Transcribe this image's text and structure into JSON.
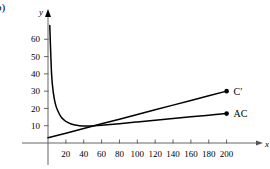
{
  "figure": {
    "panel_label": "b)",
    "x_axis_label": "x",
    "y_axis_label": "y"
  },
  "chart_data": {
    "type": "line",
    "title": "",
    "xlabel": "x",
    "ylabel": "y",
    "xlim": [
      0,
      215
    ],
    "ylim": [
      0,
      70
    ],
    "grid": false,
    "legend_position": "right-inline-labels",
    "xticks": [
      20,
      40,
      60,
      80,
      100,
      120,
      140,
      160,
      180,
      200
    ],
    "yticks": [
      10,
      20,
      30,
      40,
      50,
      60
    ],
    "xtick_labels": [
      "20",
      "40",
      "60",
      "80",
      "100",
      "120",
      "140",
      "160",
      "180",
      "200"
    ],
    "ytick_labels": [
      "10",
      "20",
      "30",
      "40",
      "50",
      "60"
    ],
    "series": [
      {
        "name": "C'",
        "label": "C′",
        "type": "line",
        "endpoint_marker": true,
        "endpoint": {
          "x": 200,
          "y": 30
        },
        "x": [
          0,
          20,
          40,
          60,
          80,
          100,
          120,
          140,
          160,
          180,
          200
        ],
        "y": [
          3.0,
          5.7,
          8.4,
          11.1,
          13.8,
          16.5,
          19.2,
          21.9,
          24.6,
          27.3,
          30.0
        ]
      },
      {
        "name": "AC",
        "label": "AC",
        "type": "curve",
        "endpoint_marker": true,
        "endpoint": {
          "x": 200,
          "y": 17
        },
        "x": [
          2,
          4,
          6,
          8,
          10,
          14,
          18,
          22,
          26,
          30,
          35,
          40,
          50,
          60,
          80,
          100,
          120,
          140,
          160,
          180,
          200
        ],
        "y": [
          68.0,
          40.0,
          29.0,
          23.2,
          19.8,
          15.6,
          13.3,
          11.9,
          11.0,
          10.4,
          10.0,
          9.8,
          9.9,
          10.2,
          11.2,
          12.2,
          13.2,
          14.2,
          15.2,
          16.1,
          17.0
        ]
      }
    ]
  },
  "style": {
    "axis_color": "#555555",
    "curve_color": "#000000",
    "background": "#ffffff"
  }
}
